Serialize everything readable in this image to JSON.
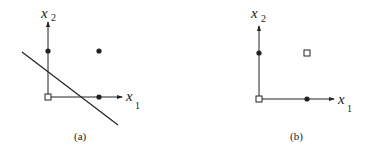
{
  "figure": {
    "panels": [
      {
        "id": "a",
        "caption": "(a)",
        "x_axis_label": "x",
        "x_axis_sub": "1",
        "y_axis_label": "x",
        "y_axis_sub": "2",
        "points": [
          {
            "position": "origin",
            "marker": "hollow-square"
          },
          {
            "position": "(0,1)",
            "marker": "filled-circle"
          },
          {
            "position": "(1,1)",
            "marker": "filled-circle"
          },
          {
            "position": "(1,0)",
            "marker": "filled-circle"
          }
        ],
        "decision_line": true
      },
      {
        "id": "b",
        "caption": "(b)",
        "x_axis_label": "x",
        "x_axis_sub": "1",
        "y_axis_label": "x",
        "y_axis_sub": "2",
        "points": [
          {
            "position": "origin",
            "marker": "hollow-square"
          },
          {
            "position": "(0,1)",
            "marker": "filled-circle"
          },
          {
            "position": "(1,1)",
            "marker": "hollow-square"
          },
          {
            "position": "(1,0)",
            "marker": "filled-circle"
          }
        ],
        "decision_line": false
      }
    ],
    "colors": {
      "ink": "#222222",
      "background": "#ffffff"
    }
  }
}
